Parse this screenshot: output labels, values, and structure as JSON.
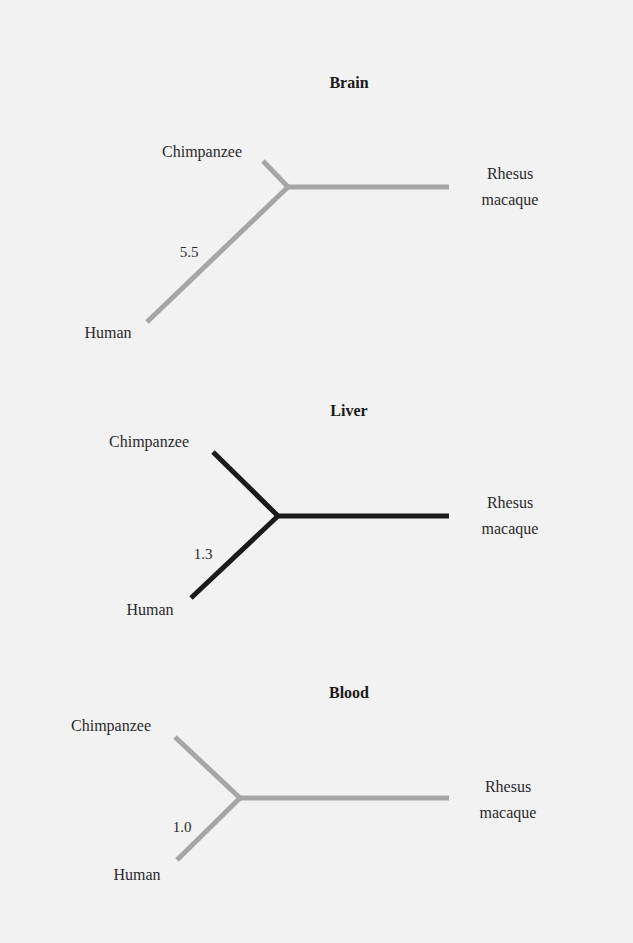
{
  "trees": [
    {
      "title": "Brain",
      "color": "#a6a6a6",
      "distance": "5.5",
      "leaves": {
        "chimp": "Chimpanzee",
        "human": "Human",
        "rhesus_line1": "Rhesus",
        "rhesus_line2": "macaque"
      },
      "geometry": {
        "title": [
          349,
          88
        ],
        "junction": [
          288,
          187
        ],
        "chimp_end": [
          263,
          161
        ],
        "human_end": [
          147,
          322
        ],
        "rhesus_end": [
          449,
          187
        ],
        "chimp_label": [
          202,
          157,
          "middle"
        ],
        "human_label": [
          108,
          338,
          "middle"
        ],
        "rhesus_label1": [
          510,
          179
        ],
        "rhesus_label2": [
          510,
          205
        ],
        "dist_label": [
          189,
          257
        ]
      }
    },
    {
      "title": "Liver",
      "color": "#1a1a1a",
      "distance": "1.3",
      "leaves": {
        "chimp": "Chimpanzee",
        "human": "Human",
        "rhesus_line1": "Rhesus",
        "rhesus_line2": "macaque"
      },
      "geometry": {
        "title": [
          349,
          416
        ],
        "junction": [
          278,
          516
        ],
        "chimp_end": [
          213,
          452
        ],
        "human_end": [
          191,
          598
        ],
        "rhesus_end": [
          449,
          516
        ],
        "chimp_label": [
          149,
          447,
          "middle"
        ],
        "human_label": [
          150,
          615,
          "middle"
        ],
        "rhesus_label1": [
          510,
          508
        ],
        "rhesus_label2": [
          510,
          534
        ],
        "dist_label": [
          203,
          559
        ]
      }
    },
    {
      "title": "Blood",
      "color": "#a6a6a6",
      "distance": "1.0",
      "leaves": {
        "chimp": "Chimpanzee",
        "human": "Human",
        "rhesus_line1": "Rhesus",
        "rhesus_line2": "macaque"
      },
      "geometry": {
        "title": [
          349,
          698
        ],
        "junction": [
          240,
          798
        ],
        "chimp_end": [
          175,
          737
        ],
        "human_end": [
          177,
          860
        ],
        "rhesus_end": [
          449,
          798
        ],
        "chimp_label": [
          111,
          731,
          "middle"
        ],
        "human_label": [
          137,
          880,
          "middle"
        ],
        "rhesus_label1": [
          508,
          792
        ],
        "rhesus_label2": [
          508,
          818
        ],
        "dist_label": [
          182,
          832
        ]
      }
    }
  ]
}
